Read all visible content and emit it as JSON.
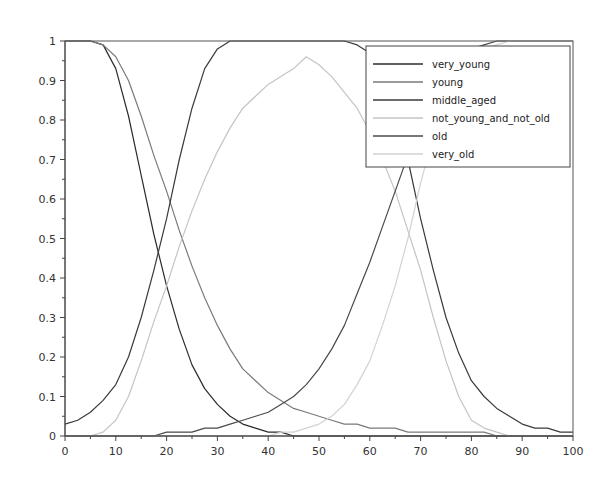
{
  "chart_data": {
    "type": "line",
    "title": "",
    "xlabel": "",
    "ylabel": "",
    "xlim": [
      0,
      100
    ],
    "ylim": [
      0,
      1
    ],
    "grid": false,
    "legend_position": "upper right",
    "x_ticks": [
      "0",
      "10",
      "20",
      "30",
      "40",
      "50",
      "60",
      "70",
      "80",
      "90",
      "100"
    ],
    "y_ticks": [
      "0",
      "0.1",
      "0.2",
      "0.3",
      "0.4",
      "0.5",
      "0.6",
      "0.7",
      "0.8",
      "0.9",
      "1"
    ],
    "x": [
      0,
      2.5,
      5,
      7.5,
      10,
      12.5,
      15,
      17.5,
      20,
      22.5,
      25,
      27.5,
      30,
      32.5,
      35,
      37.5,
      40,
      42.5,
      45,
      47.5,
      50,
      52.5,
      55,
      57.5,
      60,
      62.5,
      65,
      67.5,
      70,
      72.5,
      75,
      77.5,
      80,
      82.5,
      85,
      87.5,
      90,
      92.5,
      95,
      97.5,
      100
    ],
    "series": [
      {
        "name": "very_young",
        "color": "#2b2b2b",
        "values": [
          1,
          1,
          1,
          0.99,
          0.93,
          0.81,
          0.66,
          0.51,
          0.38,
          0.27,
          0.18,
          0.12,
          0.08,
          0.05,
          0.03,
          0.02,
          0.01,
          0.01,
          0,
          0,
          0,
          0,
          0,
          0,
          0,
          0,
          0,
          0,
          0,
          0,
          0,
          0,
          0,
          0,
          0,
          0,
          0,
          0,
          0,
          0,
          0
        ]
      },
      {
        "name": "young",
        "color": "#7a7a7a",
        "values": [
          1,
          1,
          1,
          0.99,
          0.96,
          0.9,
          0.81,
          0.71,
          0.62,
          0.52,
          0.43,
          0.35,
          0.28,
          0.22,
          0.17,
          0.14,
          0.11,
          0.09,
          0.07,
          0.06,
          0.05,
          0.04,
          0.03,
          0.03,
          0.02,
          0.02,
          0.02,
          0.01,
          0.01,
          0.01,
          0.01,
          0.01,
          0.01,
          0.01,
          0,
          0,
          0,
          0,
          0,
          0,
          0
        ]
      },
      {
        "name": "middle_aged",
        "color": "#3a3a3a",
        "values": [
          0.03,
          0.04,
          0.06,
          0.09,
          0.13,
          0.2,
          0.3,
          0.42,
          0.55,
          0.7,
          0.83,
          0.93,
          0.98,
          1,
          1,
          1,
          1,
          1,
          1,
          1,
          1,
          1,
          1,
          0.99,
          0.97,
          0.92,
          0.83,
          0.7,
          0.55,
          0.42,
          0.3,
          0.21,
          0.14,
          0.1,
          0.07,
          0.05,
          0.03,
          0.02,
          0.02,
          0.01,
          0.01
        ]
      },
      {
        "name": "not_young_and_not_old",
        "color": "#c4c4c4",
        "values": [
          0,
          0,
          0,
          0.01,
          0.04,
          0.1,
          0.19,
          0.29,
          0.38,
          0.48,
          0.57,
          0.65,
          0.72,
          0.78,
          0.83,
          0.86,
          0.89,
          0.91,
          0.93,
          0.96,
          0.94,
          0.91,
          0.87,
          0.83,
          0.77,
          0.7,
          0.62,
          0.52,
          0.42,
          0.3,
          0.19,
          0.1,
          0.04,
          0.02,
          0.01,
          0,
          0,
          0,
          0,
          0,
          0
        ]
      },
      {
        "name": "old",
        "color": "#4a4a4a",
        "values": [
          0,
          0,
          0,
          0,
          0,
          0,
          0,
          0,
          0.01,
          0.01,
          0.01,
          0.02,
          0.02,
          0.03,
          0.04,
          0.05,
          0.06,
          0.08,
          0.1,
          0.13,
          0.17,
          0.22,
          0.28,
          0.36,
          0.44,
          0.53,
          0.62,
          0.71,
          0.8,
          0.87,
          0.92,
          0.96,
          0.98,
          0.99,
          1,
          1,
          1,
          1,
          1,
          1,
          1
        ]
      },
      {
        "name": "very_old",
        "color": "#d2d2d2",
        "values": [
          0,
          0,
          0,
          0,
          0,
          0,
          0,
          0,
          0,
          0,
          0,
          0,
          0,
          0,
          0,
          0,
          0,
          0.01,
          0.01,
          0.02,
          0.03,
          0.05,
          0.08,
          0.13,
          0.19,
          0.28,
          0.38,
          0.5,
          0.64,
          0.76,
          0.85,
          0.92,
          0.96,
          0.98,
          0.99,
          1,
          1,
          1,
          1,
          1,
          1
        ]
      }
    ]
  }
}
